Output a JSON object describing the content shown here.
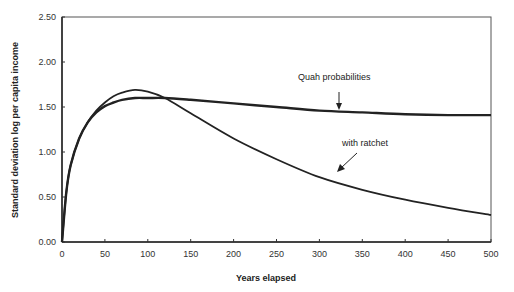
{
  "chart_data": {
    "type": "line",
    "title": "",
    "xlabel": "Years elapsed",
    "ylabel": "Standard deviation log per capita income",
    "xlim": [
      0,
      500
    ],
    "ylim": [
      0,
      2.5
    ],
    "x_ticks": [
      "0",
      "50",
      "100",
      "150",
      "200",
      "250",
      "300",
      "350",
      "400",
      "450",
      "500"
    ],
    "y_ticks": [
      "0.00",
      "0.50",
      "1.00",
      "1.50",
      "2.00",
      "2.50"
    ],
    "grid": false,
    "legend": "none (inline annotations)",
    "x": [
      0,
      5,
      10,
      20,
      30,
      40,
      50,
      60,
      70,
      85,
      100,
      120,
      150,
      200,
      250,
      300,
      350,
      400,
      450,
      500
    ],
    "series": [
      {
        "name": "Quah probabilities",
        "values": [
          0.0,
          0.55,
          0.85,
          1.15,
          1.33,
          1.44,
          1.51,
          1.55,
          1.58,
          1.6,
          1.6,
          1.6,
          1.58,
          1.54,
          1.5,
          1.46,
          1.44,
          1.42,
          1.41,
          1.41
        ]
      },
      {
        "name": "with ratchet",
        "values": [
          0.0,
          0.55,
          0.85,
          1.15,
          1.33,
          1.46,
          1.55,
          1.62,
          1.66,
          1.69,
          1.67,
          1.6,
          1.43,
          1.15,
          0.92,
          0.72,
          0.58,
          0.47,
          0.38,
          0.3
        ]
      }
    ],
    "annotations": [
      {
        "text": "Quah probabilities",
        "arrow_to": [
          325,
          1.47
        ]
      },
      {
        "text": "with ratchet",
        "arrow_to": [
          320,
          0.67
        ]
      }
    ]
  }
}
